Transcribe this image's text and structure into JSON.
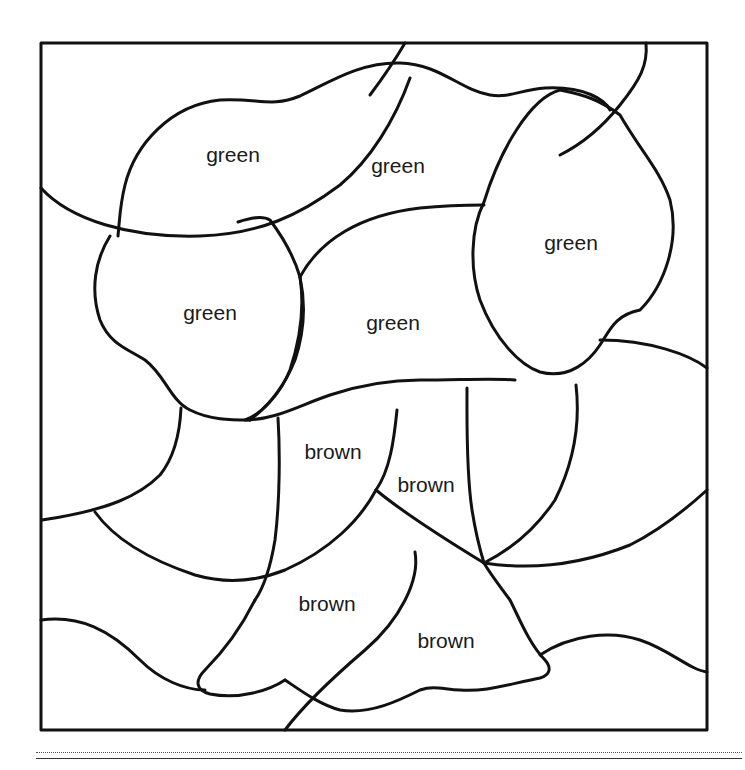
{
  "page": {
    "type": "color-by-word worksheet"
  },
  "regions": [
    {
      "label": "green",
      "x": 233,
      "y": 155
    },
    {
      "label": "green",
      "x": 398,
      "y": 166
    },
    {
      "label": "green",
      "x": 571,
      "y": 243
    },
    {
      "label": "green",
      "x": 210,
      "y": 313
    },
    {
      "label": "green",
      "x": 393,
      "y": 323
    },
    {
      "label": "brown",
      "x": 333,
      "y": 452
    },
    {
      "label": "brown",
      "x": 426,
      "y": 485
    },
    {
      "label": "brown",
      "x": 327,
      "y": 604
    },
    {
      "label": "brown",
      "x": 446,
      "y": 641
    }
  ],
  "colors": {
    "stroke": "#111111",
    "text": "#1a1a1a",
    "background": "#ffffff"
  }
}
